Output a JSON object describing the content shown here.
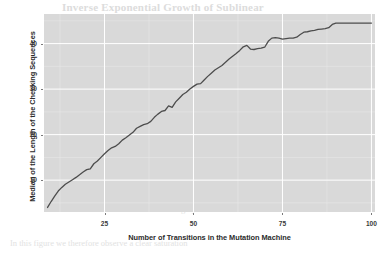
{
  "page_bleed": {
    "title": "Inverse Exponential Growth of Sublinear",
    "lines": [
      "results of our experiments on randomly generated",
      "machines with increasing numbers of transitions and",
      "the checking sequences computed from them. Each",
      "point represents the median over many repetitions",
      "As the number of transitions grows the median length",
      "of the checking sequences increases rapidly at first",
      "and then levels off, approaching a stable asymptote",
      "for machines with more than about eighty transitions.",
      "In this figure we therefore observe a clear saturation"
    ]
  },
  "chart_data": {
    "type": "line",
    "title": "",
    "subtitle": "",
    "xlabel": "Number of Transitions in the Mutation Machine",
    "ylabel": "Median of the Length of the Checking Sequences",
    "xlim": [
      8,
      101
    ],
    "ylim": [
      3.0,
      46.5
    ],
    "xticks": [
      25,
      50,
      75,
      100
    ],
    "yticks": [
      10,
      20,
      30,
      40
    ],
    "grid": true,
    "grid_color": "#ffffff",
    "panel_color": "#d9d9d9",
    "line_color": "#4d4d4d",
    "line_width": 1.3,
    "legend": "none",
    "series": [
      {
        "name": "Median checking sequence length",
        "x": [
          9,
          10,
          11,
          12,
          13,
          14,
          15,
          16,
          17,
          18,
          19,
          20,
          21,
          22,
          23,
          24,
          25,
          26,
          27,
          28,
          29,
          30,
          31,
          32,
          33,
          34,
          35,
          36,
          37,
          38,
          39,
          40,
          41,
          42,
          43,
          44,
          45,
          46,
          47,
          48,
          49,
          50,
          51,
          52,
          53,
          54,
          55,
          56,
          57,
          58,
          59,
          60,
          61,
          62,
          63,
          64,
          65,
          66,
          67,
          68,
          69,
          70,
          71,
          72,
          73,
          74,
          75,
          76,
          77,
          78,
          79,
          80,
          81,
          82,
          83,
          84,
          85,
          86,
          87,
          88,
          89,
          90,
          91,
          92,
          93,
          94,
          95,
          96,
          97,
          98,
          99,
          100
        ],
        "y": [
          4.0,
          5.3,
          6.5,
          7.6,
          8.4,
          9.1,
          9.6,
          10.1,
          10.6,
          11.2,
          11.8,
          12.3,
          12.5,
          13.6,
          14.2,
          15.0,
          15.8,
          16.5,
          17.1,
          17.4,
          18.0,
          18.8,
          19.3,
          19.9,
          20.5,
          21.4,
          21.8,
          22.2,
          22.4,
          22.9,
          23.8,
          24.5,
          25.1,
          25.3,
          26.3,
          26.0,
          27.2,
          28.0,
          28.8,
          29.3,
          30.0,
          30.6,
          31.1,
          31.2,
          32.0,
          32.8,
          33.5,
          34.2,
          34.7,
          35.2,
          35.9,
          36.6,
          37.2,
          37.8,
          38.5,
          39.3,
          39.6,
          38.8,
          38.7,
          38.9,
          39.0,
          39.2,
          40.5,
          41.2,
          41.3,
          41.2,
          41.0,
          41.1,
          41.2,
          41.2,
          41.4,
          42.0,
          42.5,
          42.6,
          42.8,
          42.9,
          43.1,
          43.2,
          43.3,
          43.5,
          44.2,
          44.5,
          44.5,
          44.5,
          44.5,
          44.5,
          44.5,
          44.5,
          44.5,
          44.5,
          44.5,
          44.5
        ]
      }
    ]
  }
}
